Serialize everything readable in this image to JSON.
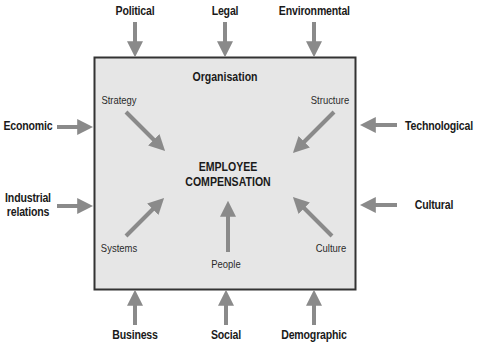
{
  "diagram": {
    "type": "influence-diagram",
    "colors": {
      "box_fill": "#e6e6e6",
      "box_border": "#333333",
      "arrow": "#8a8a8a",
      "text": "#1a1a1a"
    },
    "box": {
      "title": "Organisation",
      "center_line1": "EMPLOYEE",
      "center_line2": "COMPENSATION"
    },
    "internal_factors": {
      "strategy": "Strategy",
      "structure": "Structure",
      "systems": "Systems",
      "people": "People",
      "culture": "Culture"
    },
    "external_factors": {
      "top": [
        "Political",
        "Legal",
        "Environmental"
      ],
      "left": {
        "economic": "Economic",
        "industrial_line1": "Industrial",
        "industrial_line2": "relations"
      },
      "right": [
        "Technological",
        "Cultural"
      ],
      "bottom": [
        "Business",
        "Social",
        "Demographic"
      ]
    }
  }
}
